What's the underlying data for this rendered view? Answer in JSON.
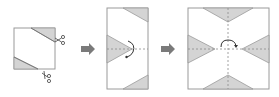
{
  "diagram": {
    "colors": {
      "paper_fill": "#ffffff",
      "outline": "#9a9a9a",
      "shaded": "#d4d4d4",
      "fold_line": "#8a8a8a",
      "arrow": "#7a7a7a",
      "curve_arrow": "#333333"
    },
    "steps": [
      {
        "id": 1,
        "label": "Folded square with two corners cut off",
        "icons": [
          "scissors-icon",
          "scissors-icon"
        ]
      },
      {
        "id": 2,
        "label": "Unfolded once, fold back along horizontal dashed line",
        "icons": [
          "curved-arrow-icon"
        ]
      },
      {
        "id": 3,
        "label": "Fully unfolded square with four triangular cutouts",
        "icons": [
          "curved-arrow-icon"
        ]
      }
    ],
    "arrows": [
      "right-arrow-icon",
      "right-arrow-icon"
    ]
  }
}
